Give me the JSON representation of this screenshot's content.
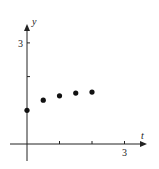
{
  "chart_data": {
    "type": "scatter",
    "title": "",
    "xlabel": "t",
    "ylabel": "y",
    "x_ticks": [
      1,
      2,
      3
    ],
    "x_tick_labels": [
      "",
      "",
      "3"
    ],
    "y_ticks": [
      2,
      3
    ],
    "y_tick_labels": [
      "",
      "3"
    ],
    "xlim": [
      -0.4,
      3.6
    ],
    "ylim": [
      -1.2,
      3.9
    ],
    "grid": false,
    "legend": null,
    "series": [
      {
        "name": "points",
        "x": [
          0,
          0.5,
          1,
          1.5,
          2
        ],
        "y": [
          1.0,
          1.3,
          1.43,
          1.51,
          1.54
        ]
      }
    ]
  },
  "labels": {
    "x_axis": "t",
    "y_axis": "y",
    "x_tick_3": "3",
    "y_tick_3": "3"
  }
}
